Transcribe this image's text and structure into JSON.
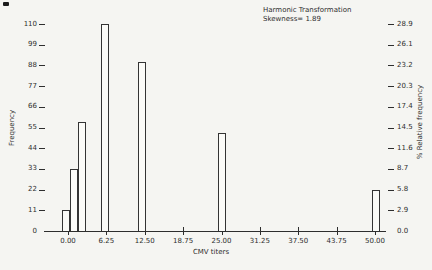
{
  "figure": {
    "title": "Harmonic Transformation",
    "annotation": "Skewness= 1.89"
  },
  "chart_data": {
    "type": "bar",
    "title": "Harmonic Transformation",
    "annotation": "Skewness= 1.89",
    "xlabel": "CMV titers",
    "ylabel_left": "Frequency",
    "ylabel_right": "% Relative frequency",
    "xlim": [
      0,
      50
    ],
    "ylim_left": [
      0,
      110
    ],
    "ylim_right": [
      0,
      28.9
    ],
    "grid": false,
    "legend": false,
    "x_tick_values": [
      0,
      6.25,
      12.5,
      18.75,
      25,
      31.25,
      37.5,
      43.75,
      50
    ],
    "x_tick_labels": [
      "0.00",
      "6.25",
      "12.50",
      "18.75",
      "25.00",
      "31.25",
      "37.50",
      "43.75",
      "50.00"
    ],
    "y_tick_values_left": [
      110,
      99,
      88,
      77,
      66,
      55,
      44,
      33,
      22,
      11,
      0
    ],
    "y_tick_labels_left": [
      "110",
      "99",
      "88",
      "77",
      "66",
      "55",
      "44",
      "33",
      "22",
      "11",
      "0"
    ],
    "y_tick_values_right": [
      28.9,
      26.1,
      23.2,
      20.3,
      17.4,
      14.5,
      11.6,
      8.7,
      5.8,
      2.9,
      0.0
    ],
    "y_tick_labels_right": [
      "28.9",
      "26.1",
      "23.2",
      "20.3",
      "17.4",
      "14.5",
      "11.6",
      "8.7",
      "5.8",
      "2.9",
      "0.0"
    ],
    "bar_width_units": 1.3,
    "bars": [
      {
        "x_center": -0.3,
        "frequency": 11
      },
      {
        "x_center": 1.0,
        "frequency": 33
      },
      {
        "x_center": 2.3,
        "frequency": 58
      },
      {
        "x_center": 6.0,
        "frequency": 110
      },
      {
        "x_center": 12.0,
        "frequency": 90
      },
      {
        "x_center": 25.1,
        "frequency": 52
      },
      {
        "x_center": 50.1,
        "frequency": 22
      }
    ],
    "colors": {
      "background": "#f5f5f2",
      "line": "#2e2e2e",
      "bar_fill": "#fbfbf8"
    }
  }
}
